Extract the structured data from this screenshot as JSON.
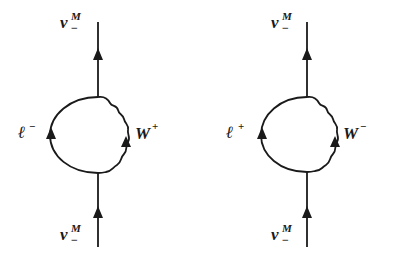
{
  "figure": {
    "type": "feynman-diagrams",
    "panels": [
      {
        "id": "left",
        "top_label": {
          "base": "ν",
          "sup": "M",
          "sub": "−"
        },
        "bottom_label": {
          "base": "ν",
          "sup": "M",
          "sub": "−"
        },
        "fermion_loop_label": {
          "base": "ℓ",
          "sup": "−"
        },
        "boson_label": {
          "base": "W",
          "sup": "+"
        }
      },
      {
        "id": "right",
        "top_label": {
          "base": "ν",
          "sup": "M",
          "sub": "−"
        },
        "bottom_label": {
          "base": "ν",
          "sup": "M",
          "sub": "−"
        },
        "fermion_loop_label": {
          "base": "ℓ",
          "sup": "+"
        },
        "boson_label": {
          "base": "W",
          "sup": "−"
        }
      }
    ]
  },
  "colors": {
    "ink": "#1a1a1a",
    "background": "#ffffff"
  }
}
